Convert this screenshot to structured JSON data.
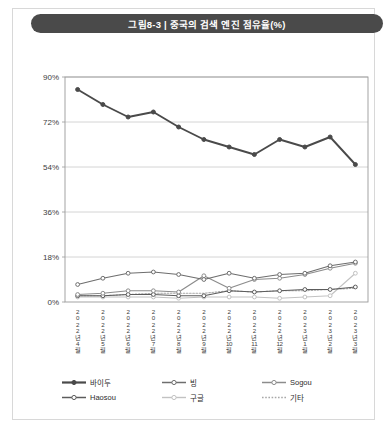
{
  "figure": {
    "tag": "그림8-3",
    "separator": "|",
    "title": "중국의 검색 엔진 점유율(%)",
    "title_full": "그림8-3 | 중국의 검색 엔진 점유율(%)"
  },
  "colors": {
    "title_bar": "#4a4a4a",
    "title_text": "#ffffff",
    "card_border": "#d8d8d8",
    "plot_border": "#9a9a9a",
    "gridline": "#c9c9c9",
    "baidu": "#4a4a4a",
    "bing": "#6e6e6e",
    "sogou": "#8c8c8c",
    "haosou": "#5c5c5c",
    "google": "#c2c2c2",
    "etc": "#a8a8a8"
  },
  "chart_data": {
    "type": "line",
    "title": "중국의 검색 엔진 점유율(%)",
    "xlabel": "",
    "ylabel": "",
    "ylim": [
      0,
      90
    ],
    "yticks": [
      0,
      18,
      36,
      54,
      72,
      90
    ],
    "ytick_labels": [
      "0%",
      "18%",
      "36%",
      "54%",
      "72%",
      "90%"
    ],
    "grid": true,
    "legend_position": "bottom",
    "categories": [
      "2022년 4월",
      "2022년 5월",
      "2022년 6월",
      "2022년 7월",
      "2022년 8월",
      "2022년 9월",
      "2022년 10월",
      "2022년 11월",
      "2022년 12월",
      "2023년 1월",
      "2023년 2월",
      "2023년 3월"
    ],
    "category_lines": [
      [
        "2",
        "0",
        "2",
        "2",
        "년",
        "4",
        "월"
      ],
      [
        "2",
        "0",
        "2",
        "2",
        "년",
        "5",
        "월"
      ],
      [
        "2",
        "0",
        "2",
        "2",
        "년",
        "6",
        "월"
      ],
      [
        "2",
        "0",
        "2",
        "2",
        "년",
        "7",
        "월"
      ],
      [
        "2",
        "0",
        "2",
        "2",
        "년",
        "8",
        "월"
      ],
      [
        "2",
        "0",
        "2",
        "2",
        "년",
        "9",
        "월"
      ],
      [
        "2",
        "0",
        "2",
        "2",
        "년",
        "10",
        "월"
      ],
      [
        "2",
        "0",
        "2",
        "2",
        "년",
        "11",
        "월"
      ],
      [
        "2",
        "0",
        "2",
        "2",
        "년",
        "12",
        "월"
      ],
      [
        "2",
        "0",
        "2",
        "3",
        "년",
        "1",
        "월"
      ],
      [
        "2",
        "0",
        "2",
        "3",
        "년",
        "2",
        "월"
      ],
      [
        "2",
        "0",
        "2",
        "3",
        "년",
        "3",
        "월"
      ]
    ],
    "series": [
      {
        "name": "바이두",
        "key": "baidu",
        "color": "#4a4a4a",
        "style": "solid-thick",
        "marker": "filled-circle",
        "values": [
          85.0,
          79.0,
          74.0,
          76.0,
          70.0,
          65.0,
          62.0,
          59.0,
          65.0,
          62.0,
          66.0,
          55.0
        ]
      },
      {
        "name": "빙",
        "key": "bing",
        "color": "#6e6e6e",
        "style": "solid",
        "marker": "open-circle",
        "values": [
          7.0,
          9.5,
          11.5,
          12.0,
          11.0,
          9.0,
          11.5,
          9.5,
          11.0,
          11.5,
          14.5,
          16.0
        ]
      },
      {
        "name": "Sogou",
        "key": "sogou",
        "color": "#8c8c8c",
        "style": "solid",
        "marker": "open-circle",
        "values": [
          3.0,
          3.5,
          4.5,
          4.5,
          4.0,
          10.5,
          5.5,
          9.0,
          9.5,
          11.0,
          13.5,
          15.5
        ]
      },
      {
        "name": "Haosou",
        "key": "haosou",
        "color": "#5c5c5c",
        "style": "solid",
        "marker": "open-circle",
        "values": [
          2.5,
          2.5,
          3.0,
          3.0,
          2.5,
          2.5,
          4.5,
          4.0,
          4.5,
          5.0,
          5.0,
          6.0
        ]
      },
      {
        "name": "구글",
        "key": "google",
        "color": "#c2c2c2",
        "style": "solid-light",
        "marker": "open-circle",
        "values": [
          2.0,
          2.0,
          2.0,
          2.0,
          1.5,
          2.0,
          2.0,
          2.0,
          1.5,
          2.0,
          2.5,
          11.5
        ]
      },
      {
        "name": "기타",
        "key": "etc",
        "color": "#a8a8a8",
        "style": "dotted",
        "marker": "none",
        "values": [
          2.5,
          2.5,
          3.0,
          3.5,
          3.5,
          3.5,
          4.5,
          4.0,
          4.5,
          4.5,
          5.0,
          5.5
        ]
      }
    ]
  },
  "legend": {
    "row1": [
      {
        "label": "바이두",
        "key": "baidu"
      },
      {
        "label": "빙",
        "key": "bing"
      },
      {
        "label": "Sogou",
        "key": "sogou"
      }
    ],
    "row2": [
      {
        "label": "Haosou",
        "key": "haosou"
      },
      {
        "label": "구글",
        "key": "google"
      },
      {
        "label": "기타",
        "key": "etc"
      }
    ]
  }
}
